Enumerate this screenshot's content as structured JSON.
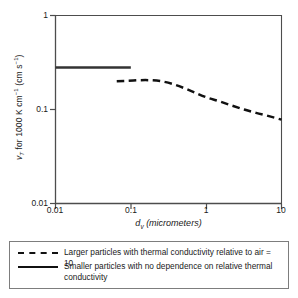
{
  "chart_data": {
    "type": "line",
    "title": "",
    "xlabel": "d_v (micrometers)",
    "ylabel": "v_T for 1000 K cm^-1 (cm s^-1)",
    "xscale": "log",
    "yscale": "log",
    "xlim": [
      0.01,
      10
    ],
    "ylim": [
      0.01,
      1
    ],
    "xticks": [
      "0.01",
      "0.1",
      "1",
      "10"
    ],
    "xtick_values": [
      0.01,
      0.1,
      1,
      10
    ],
    "yticks": [
      "0.01",
      "0.1",
      "1"
    ],
    "ytick_values": [
      0.01,
      0.1,
      1
    ],
    "grid": false,
    "legend_position": "below-plot",
    "series": [
      {
        "name": "Larger particles with thermal conductivity relative to air = 10",
        "style": "dashed",
        "color": "#111111",
        "x": [
          0.065,
          0.09,
          0.13,
          0.18,
          0.25,
          0.35,
          0.5,
          0.7,
          1.0,
          1.5,
          2.2,
          3.2,
          4.6,
          6.8,
          10.0
        ],
        "y": [
          0.2,
          0.202,
          0.205,
          0.205,
          0.2,
          0.188,
          0.17,
          0.152,
          0.135,
          0.122,
          0.11,
          0.1,
          0.092,
          0.085,
          0.078
        ]
      },
      {
        "name": "Smaller particles with no dependence on relative thermal conductivity",
        "style": "solid",
        "color": "#333333",
        "x": [
          0.01,
          0.1
        ],
        "y": [
          0.28,
          0.28
        ]
      }
    ]
  },
  "axes": {
    "y_label_parts": {
      "v": "v",
      "sub_T": "T",
      "mid": " for 1000 K cm",
      "sup1": "−1",
      "open": " (cm s",
      "sup2": "−1",
      "close": ")"
    },
    "x_label_parts": {
      "d": "d",
      "sub_v": "v",
      "rest": " (micrometers)"
    },
    "ytick_labels": [
      "1",
      "0.1",
      "0.01"
    ],
    "xtick_labels": [
      "0.01",
      "0.1",
      "1",
      "10"
    ]
  },
  "legend": {
    "entries": [
      {
        "key": "dashed-line",
        "label": "Larger particles with thermal conductivity relative to air = 10"
      },
      {
        "key": "solid-line",
        "label": "Smaller particles with no dependence on relative thermal conductivity"
      }
    ]
  },
  "colors": {
    "axis": "#4d4d4d",
    "dashed_series": "#111111",
    "solid_series": "#333333",
    "legend_border": "#7d7d7d",
    "text": "#1a1a1a",
    "background": "#ffffff"
  }
}
